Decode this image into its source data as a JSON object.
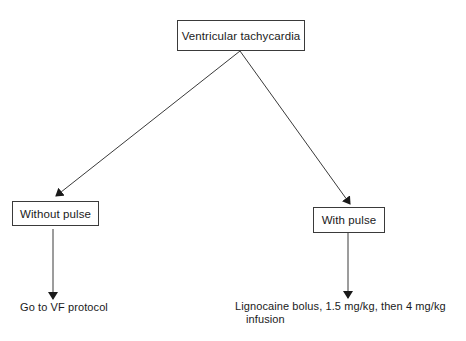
{
  "diagram": {
    "type": "flowchart",
    "root": {
      "id": "vt",
      "label": "Ventricular tachycardia"
    },
    "branches": [
      {
        "id": "without-pulse",
        "label": "Without pulse",
        "outcome": {
          "line1": "Go to VF protocol",
          "line2": ""
        }
      },
      {
        "id": "with-pulse",
        "label": "With pulse",
        "outcome": {
          "line1": "Lignocaine bolus, 1.5 mg/kg, then 4 mg/kg",
          "line2": "infusion"
        }
      }
    ],
    "edges": [
      {
        "from": "vt",
        "to": "without-pulse"
      },
      {
        "from": "vt",
        "to": "with-pulse"
      },
      {
        "from": "without-pulse",
        "to": "go-to-vf-protocol"
      },
      {
        "from": "with-pulse",
        "to": "lignocaine-bolus"
      }
    ],
    "colors": {
      "line": "#3a3a3a",
      "text": "#1a1a1a",
      "background": "#ffffff"
    }
  }
}
